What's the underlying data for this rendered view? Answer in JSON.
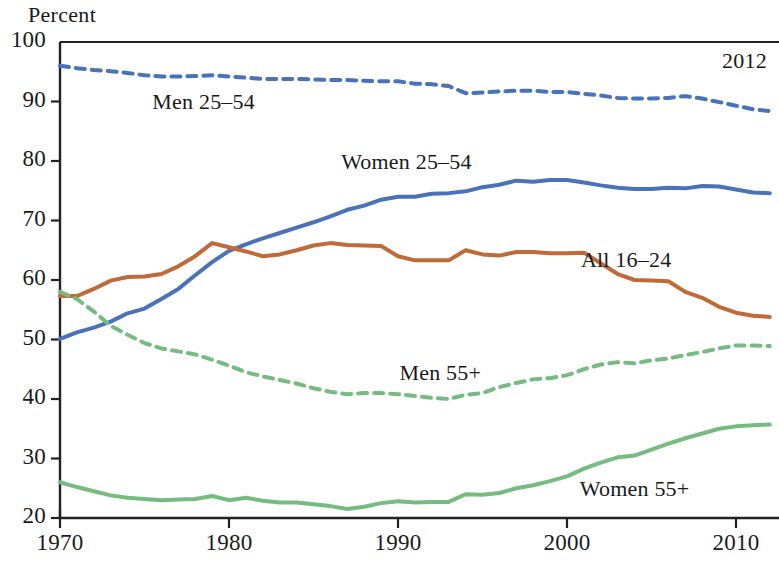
{
  "chart_data": {
    "type": "line",
    "title": "",
    "subtitle": "",
    "ylabel": "Percent",
    "xlabel": "",
    "ylim": [
      20,
      100
    ],
    "xlim": [
      1970,
      2012
    ],
    "grid": false,
    "legend_position": "inline-annotations",
    "y_ticks": [
      20,
      30,
      40,
      50,
      60,
      70,
      80,
      90,
      100
    ],
    "y_tick_labels": [
      "20",
      "30",
      "40",
      "50",
      "60",
      "70",
      "80",
      "90",
      "100"
    ],
    "x_ticks": [
      1970,
      1980,
      1990,
      2000,
      2010
    ],
    "x_tick_labels": [
      "1970",
      "1980",
      "1990",
      "2000",
      "2010"
    ],
    "annotations": [
      {
        "text": "2012",
        "x": 2010.5,
        "y": 96.5,
        "name": "end-year-annotation"
      }
    ],
    "x": [
      1970,
      1971,
      1972,
      1973,
      1974,
      1975,
      1976,
      1977,
      1978,
      1979,
      1980,
      1981,
      1982,
      1983,
      1984,
      1985,
      1986,
      1987,
      1988,
      1989,
      1990,
      1991,
      1992,
      1993,
      1994,
      1995,
      1996,
      1997,
      1998,
      1999,
      2000,
      2001,
      2002,
      2003,
      2004,
      2005,
      2006,
      2007,
      2008,
      2009,
      2010,
      2011,
      2012
    ],
    "series": [
      {
        "name": "Men 25–54",
        "color": "#4a72b8",
        "style": "dashed",
        "label_x": 1978.5,
        "label_y": 89.5,
        "values": [
          96.0,
          95.6,
          95.3,
          95.1,
          94.8,
          94.4,
          94.2,
          94.2,
          94.3,
          94.4,
          94.2,
          94.0,
          93.8,
          93.8,
          93.8,
          93.7,
          93.6,
          93.6,
          93.5,
          93.4,
          93.4,
          93.0,
          92.9,
          92.6,
          91.4,
          91.5,
          91.7,
          91.8,
          91.8,
          91.6,
          91.6,
          91.3,
          91.0,
          90.6,
          90.5,
          90.5,
          90.6,
          90.9,
          90.5,
          89.9,
          89.3,
          88.7,
          88.4
        ]
      },
      {
        "name": "Women 25–54",
        "color": "#4a72b8",
        "style": "solid",
        "label_x": 1990.5,
        "label_y": 79.5,
        "values": [
          50.1,
          51.2,
          52.0,
          53.0,
          54.4,
          55.2,
          56.8,
          58.5,
          60.8,
          63.0,
          64.9,
          66.0,
          67.0,
          67.9,
          68.8,
          69.7,
          70.7,
          71.8,
          72.5,
          73.5,
          74.0,
          74.0,
          74.5,
          74.6,
          74.9,
          75.6,
          76.0,
          76.7,
          76.5,
          76.8,
          76.8,
          76.4,
          75.9,
          75.5,
          75.3,
          75.3,
          75.5,
          75.4,
          75.8,
          75.7,
          75.2,
          74.7,
          74.6
        ]
      },
      {
        "name": "All 16–24",
        "color": "#c06a3a",
        "style": "solid",
        "label_x": 2003.5,
        "label_y": 63.0,
        "values": [
          57.3,
          57.3,
          58.5,
          59.9,
          60.5,
          60.6,
          61.0,
          62.3,
          64.0,
          66.2,
          65.5,
          64.8,
          64.0,
          64.3,
          65.0,
          65.8,
          66.2,
          65.9,
          65.8,
          65.7,
          64.0,
          63.3,
          63.3,
          63.3,
          65.0,
          64.3,
          64.1,
          64.7,
          64.7,
          64.5,
          64.5,
          64.6,
          62.8,
          61.0,
          60.0,
          59.9,
          59.8,
          58.0,
          57.0,
          55.5,
          54.5,
          54.0,
          53.8
        ]
      },
      {
        "name": "Men 55+",
        "color": "#76bb7f",
        "style": "dashed",
        "label_x": 1992.5,
        "label_y": 44.0,
        "values": [
          58.0,
          56.8,
          54.7,
          52.3,
          50.8,
          49.4,
          48.5,
          48.0,
          47.5,
          46.6,
          45.6,
          44.5,
          43.8,
          43.2,
          42.6,
          41.8,
          41.2,
          40.8,
          41.0,
          41.0,
          40.8,
          40.5,
          40.2,
          40.0,
          40.7,
          41.0,
          42.0,
          42.7,
          43.3,
          43.5,
          44.0,
          45.0,
          45.8,
          46.2,
          46.0,
          46.5,
          46.8,
          47.4,
          47.9,
          48.5,
          49.0,
          49.0,
          48.9
        ]
      },
      {
        "name": "Women 55+",
        "color": "#76bb7f",
        "style": "solid",
        "label_x": 2004.0,
        "label_y": 24.5,
        "values": [
          26.0,
          25.2,
          24.5,
          23.8,
          23.4,
          23.2,
          23.0,
          23.1,
          23.2,
          23.7,
          23.0,
          23.4,
          22.9,
          22.6,
          22.6,
          22.3,
          22.0,
          21.5,
          21.9,
          22.5,
          22.8,
          22.6,
          22.7,
          22.7,
          24.0,
          23.9,
          24.2,
          25.0,
          25.5,
          26.2,
          27.0,
          28.3,
          29.3,
          30.2,
          30.5,
          31.5,
          32.5,
          33.4,
          34.2,
          35.0,
          35.4,
          35.6,
          35.7
        ]
      }
    ]
  },
  "axis": {
    "y_title": "Percent"
  }
}
